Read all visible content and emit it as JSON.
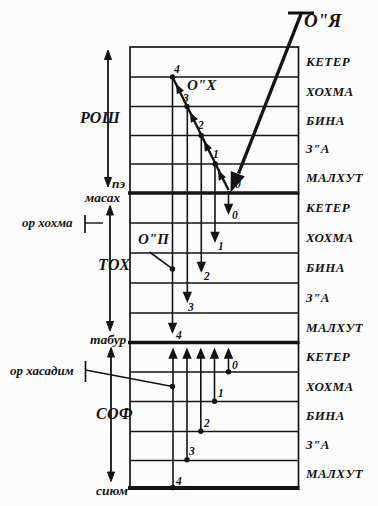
{
  "colors": {
    "ink": "#141414",
    "background": "#fcfcfc"
  },
  "lights": {
    "direct": "О\"Я",
    "returning": "О\"Х",
    "inner": "О\"П",
    "hochma": "ор хохма",
    "hasadim": "ор хасадим"
  },
  "sections": {
    "rosh": "РОШ",
    "toch": "ТОХ",
    "sof": "СОФ"
  },
  "boundaries": {
    "pe": "пэ",
    "masach": "масах",
    "tabur": "табур",
    "sium": "сиюм"
  },
  "sefirot": {
    "rosh": [
      "КЕТЕР",
      "ХОХМА",
      "БИНА",
      "З\"А",
      "МАЛХУТ"
    ],
    "toch": [
      "КЕТЕР",
      "ХОХМА",
      "БИНА",
      "З\"А",
      "МАЛХУТ"
    ],
    "sof": [
      "КЕТЕР",
      "ХОХМА",
      "БИНА",
      "З\"А",
      "МАЛХУТ"
    ]
  },
  "levels": {
    "rosh": [
      "4",
      "3",
      "2",
      "1",
      "0"
    ],
    "toch": [
      "0",
      "1",
      "2",
      "3",
      "4"
    ],
    "sof": [
      "0",
      "1",
      "2",
      "3",
      "4"
    ]
  }
}
